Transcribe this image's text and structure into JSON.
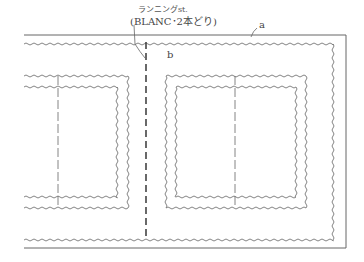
{
  "diagram": {
    "type": "sewing-pattern-diagram",
    "annotations": {
      "running_stitch_label": "ランニングst.",
      "running_stitch_detail": "(BLANC･2本どり)",
      "label_a": "a",
      "label_b": "b"
    },
    "colors": {
      "line": "#555555",
      "wavy": "#777777",
      "background": "#ffffff"
    },
    "elements": [
      {
        "id": "outer-border",
        "style": "solid",
        "desc": "outer fabric edge (open left)"
      },
      {
        "id": "outer-wavy-frame",
        "style": "zigzag",
        "desc": "outer wavy stitch frame"
      },
      {
        "id": "center-running-stitch",
        "style": "dashed",
        "desc": "vertical running stitch"
      },
      {
        "id": "left-frame",
        "style": "double-zigzag",
        "desc": "left double wavy frame with dashed center"
      },
      {
        "id": "right-frame",
        "style": "double-zigzag",
        "desc": "right double wavy frame with dashed center"
      }
    ]
  }
}
